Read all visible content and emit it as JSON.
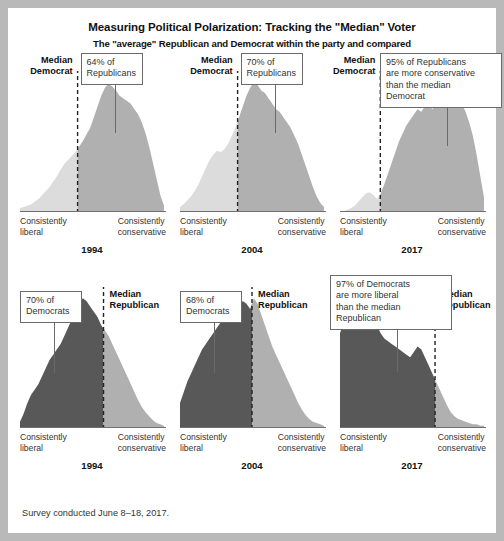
{
  "header": {
    "title": "Measuring Political Polarization: Tracking the \"Median\" Voter",
    "subtitle": "The \"average\" Republican and Democrat within the party and compared"
  },
  "footer": {
    "note": "Survey conducted June 8–18, 2017."
  },
  "axis": {
    "left_label": "Consistently\nliberal",
    "right_label": "Consistently\nconservative"
  },
  "colors": {
    "light_fill": "#dcdcdc",
    "mid_fill": "#b0b0b0",
    "dark_fill": "#585858",
    "axis": "#6f6f6f",
    "median_line": "#222222",
    "page_bg": "#ffffff",
    "outer_bg": "#b9b9b9"
  },
  "chart_data": {
    "type": "area",
    "title": "Measuring Political Polarization: Tracking the \"Median\" Voter",
    "subtitle": "The \"average\" Republican and Democrat within the party and compared",
    "xlabel_left": "Consistently liberal",
    "xlabel_right": "Consistently conservative",
    "ylabel": "",
    "grid": false,
    "legend": "none",
    "note": "Survey conducted June 8–18, 2017.",
    "x": [
      0,
      1,
      2,
      3,
      4,
      5,
      6,
      7,
      8,
      9,
      10,
      11,
      12,
      13,
      14,
      15,
      16,
      17,
      18,
      19,
      20,
      21,
      22,
      23,
      24,
      25,
      26,
      27,
      28,
      29,
      30,
      31,
      32,
      33,
      34,
      35,
      36,
      37,
      38,
      39
    ],
    "panels": [
      {
        "row": "republicans",
        "year": "1994",
        "median_label": "Median\nDemocrat",
        "median_x_frac": 0.4,
        "callout_text": "64% of\nRepublicans",
        "callout_value": 64,
        "callout_unit": "% of Republicans",
        "fill_left": "#dcdcdc",
        "fill_right": "#b0b0b0",
        "values": [
          2,
          3,
          4,
          5,
          7,
          9,
          12,
          15,
          18,
          22,
          26,
          31,
          35,
          38,
          41,
          44,
          48,
          52,
          57,
          62,
          70,
          78,
          86,
          92,
          95,
          93,
          90,
          86,
          84,
          82,
          80,
          76,
          72,
          66,
          58,
          48,
          36,
          24,
          12,
          4
        ]
      },
      {
        "row": "republicans",
        "year": "2004",
        "median_label": "Median\nDemocrat",
        "median_x_frac": 0.4,
        "callout_text": "70% of\nRepublicans",
        "callout_value": 70,
        "callout_unit": "% of Republicans",
        "fill_left": "#dcdcdc",
        "fill_right": "#b0b0b0",
        "values": [
          3,
          5,
          8,
          11,
          15,
          20,
          26,
          32,
          38,
          42,
          45,
          44,
          46,
          50,
          56,
          62,
          70,
          78,
          86,
          92,
          96,
          94,
          90,
          88,
          84,
          80,
          76,
          74,
          70,
          66,
          62,
          56,
          50,
          42,
          34,
          26,
          18,
          11,
          6,
          3
        ]
      },
      {
        "row": "republicans",
        "year": "2017",
        "median_label": "Median\nDemocrat",
        "median_x_frac": 0.28,
        "callout_text": "95% of Republicans\nare more conservative\nthan the median\nDemocrat",
        "callout_value": 95,
        "callout_unit": "% of Republicans",
        "fill_left": "#dcdcdc",
        "fill_right": "#b0b0b0",
        "values": [
          0,
          0,
          1,
          2,
          4,
          7,
          10,
          13,
          14,
          12,
          9,
          13,
          20,
          28,
          36,
          44,
          52,
          58,
          64,
          68,
          72,
          76,
          74,
          78,
          80,
          76,
          80,
          84,
          82,
          86,
          92,
          88,
          84,
          80,
          74,
          66,
          56,
          42,
          26,
          10
        ]
      },
      {
        "row": "democrats",
        "year": "1994",
        "median_label": "Median\nRepublican",
        "median_x_frac": 0.58,
        "callout_text": "70% of\nDemocrats",
        "callout_value": 70,
        "callout_unit": "% of Democrats",
        "fill_left": "#585858",
        "fill_right": "#b0b0b0",
        "values": [
          4,
          10,
          18,
          24,
          28,
          32,
          38,
          44,
          50,
          54,
          58,
          62,
          68,
          74,
          80,
          86,
          92,
          96,
          94,
          90,
          86,
          82,
          76,
          72,
          68,
          62,
          56,
          50,
          44,
          38,
          32,
          26,
          20,
          15,
          11,
          8,
          5,
          3,
          2,
          1
        ]
      },
      {
        "row": "democrats",
        "year": "2004",
        "median_label": "Median\nRepublican",
        "median_x_frac": 0.5,
        "callout_text": "68% of\nDemocrats",
        "callout_value": 68,
        "callout_unit": "% of Democrats",
        "fill_left": "#585858",
        "fill_right": "#b0b0b0",
        "values": [
          18,
          26,
          34,
          40,
          46,
          52,
          58,
          62,
          66,
          70,
          74,
          78,
          82,
          86,
          88,
          86,
          90,
          94,
          92,
          88,
          96,
          92,
          84,
          76,
          68,
          60,
          54,
          48,
          42,
          36,
          30,
          24,
          18,
          13,
          9,
          6,
          4,
          3,
          2,
          1
        ]
      },
      {
        "row": "democrats",
        "year": "2017",
        "median_label": "Median\nRepublican",
        "median_x_frac": 0.66,
        "callout_text": "97% of Democrats\nare more liberal\nthan the median\nRepublican",
        "callout_value": 97,
        "callout_unit": "% of Democrats",
        "fill_left": "#585858",
        "fill_right": "#b0b0b0",
        "values": [
          70,
          78,
          86,
          92,
          96,
          90,
          88,
          94,
          86,
          80,
          76,
          70,
          66,
          64,
          62,
          60,
          58,
          56,
          54,
          52,
          56,
          60,
          58,
          52,
          46,
          40,
          34,
          28,
          22,
          16,
          11,
          8,
          6,
          5,
          4,
          3,
          2,
          2,
          1,
          1
        ]
      }
    ]
  }
}
